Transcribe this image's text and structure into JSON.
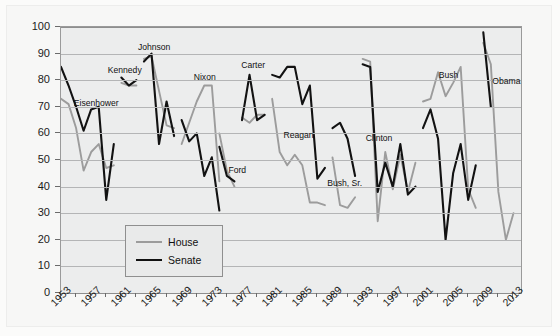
{
  "chart_data": {
    "type": "line",
    "title": "",
    "xlabel": "",
    "ylabel": "Percentage",
    "xlim": [
      1953,
      2014
    ],
    "ylim": [
      0,
      100
    ],
    "grid": true,
    "y_ticks": [
      0,
      10,
      20,
      30,
      40,
      50,
      60,
      70,
      80,
      90,
      100
    ],
    "x_tick_labels": [
      "1953",
      "1957",
      "1961",
      "1965",
      "1969",
      "1973",
      "1977",
      "1981",
      "1985",
      "1989",
      "1993",
      "1997",
      "2001",
      "2005",
      "2009",
      "2013"
    ],
    "x_minor_tick_step": 2,
    "legend": {
      "position": "inside-lower-left",
      "entries": [
        {
          "label": "House",
          "color": "#9c9c9c"
        },
        {
          "label": "Senate",
          "color": "#121212"
        }
      ]
    },
    "series": [
      {
        "name": "House",
        "color": "#9c9c9c",
        "segments": [
          {
            "era": "Eisenhower",
            "x": [
              1953,
              1954,
              1955,
              1956,
              1957,
              1958,
              1959,
              1960
            ],
            "y": [
              73,
              71,
              62,
              46,
              53,
              56,
              47,
              48
            ]
          },
          {
            "era": "Kennedy",
            "x": [
              1961,
              1962,
              1963
            ],
            "y": [
              79,
              78,
              78
            ]
          },
          {
            "era": "Johnson",
            "x": [
              1964,
              1965,
              1966,
              1967,
              1968
            ],
            "y": [
              88,
              89,
              76,
              63,
              62
            ]
          },
          {
            "era": "Nixon",
            "x": [
              1969,
              1970,
              1971,
              1972,
              1973,
              1974
            ],
            "y": [
              56,
              64,
              72,
              78,
              78,
              42
            ]
          },
          {
            "era": "Ford",
            "x": [
              1974,
              1975,
              1976
            ],
            "y": [
              60,
              46,
              40
            ]
          },
          {
            "era": "Carter",
            "x": [
              1977,
              1978,
              1979,
              1980
            ],
            "y": [
              66,
              64,
              67,
              67
            ]
          },
          {
            "era": "Reagan",
            "x": [
              1981,
              1982,
              1983,
              1984,
              1985,
              1986,
              1987,
              1988
            ],
            "y": [
              73,
              53,
              48,
              52,
              48,
              34,
              34,
              33
            ]
          },
          {
            "era": "Bush, Sr.",
            "x": [
              1989,
              1990,
              1991,
              1992
            ],
            "y": [
              51,
              33,
              32,
              36
            ]
          },
          {
            "era": "Clinton",
            "x": [
              1993,
              1994,
              1995,
              1996,
              1997,
              1998,
              1999,
              2000
            ],
            "y": [
              88,
              87,
              27,
              53,
              39,
              52,
              38,
              49
            ]
          },
          {
            "era": "Bush",
            "x": [
              2001,
              2002,
              2003,
              2004,
              2005,
              2006,
              2007,
              2008
            ],
            "y": [
              72,
              73,
              83,
              74,
              79,
              85,
              39,
              32
            ]
          },
          {
            "era": "Obama",
            "x": [
              2009,
              2010,
              2011,
              2012,
              2013
            ],
            "y": [
              94,
              86,
              38,
              20,
              30
            ]
          }
        ]
      },
      {
        "name": "Senate",
        "color": "#121212",
        "segments": [
          {
            "era": "Eisenhower",
            "x": [
              1953,
              1954,
              1955,
              1956,
              1957,
              1958,
              1959,
              1960
            ],
            "y": [
              85,
              78,
              70,
              61,
              69,
              70,
              35,
              56
            ]
          },
          {
            "era": "Kennedy",
            "x": [
              1961,
              1962,
              1963
            ],
            "y": [
              81,
              78,
              80
            ]
          },
          {
            "era": "Johnson",
            "x": [
              1964,
              1965,
              1966,
              1967,
              1968
            ],
            "y": [
              87,
              90,
              56,
              72,
              59
            ]
          },
          {
            "era": "Nixon",
            "x": [
              1969,
              1970,
              1971,
              1972,
              1973,
              1974
            ],
            "y": [
              65,
              57,
              60,
              44,
              51,
              31
            ]
          },
          {
            "era": "Ford",
            "x": [
              1974,
              1975,
              1976
            ],
            "y": [
              55,
              44,
              42
            ]
          },
          {
            "era": "Carter",
            "x": [
              1977,
              1978,
              1979,
              1980
            ],
            "y": [
              65,
              82,
              65,
              67
            ]
          },
          {
            "era": "Reagan",
            "x": [
              1981,
              1982,
              1983,
              1984,
              1985,
              1986,
              1987,
              1988
            ],
            "y": [
              82,
              81,
              85,
              85,
              71,
              78,
              43,
              47
            ]
          },
          {
            "era": "Bush, Sr.",
            "x": [
              1989,
              1990,
              1991,
              1992
            ],
            "y": [
              62,
              64,
              58,
              44
            ]
          },
          {
            "era": "Clinton",
            "x": [
              1993,
              1994,
              1995,
              1996,
              1997,
              1998,
              1999,
              2000
            ],
            "y": [
              86,
              85,
              38,
              49,
              40,
              56,
              37,
              40
            ]
          },
          {
            "era": "Bush",
            "x": [
              2001,
              2002,
              2003,
              2004,
              2005,
              2006,
              2007,
              2008
            ],
            "y": [
              62,
              69,
              58,
              20,
              45,
              56,
              35,
              48
            ]
          },
          {
            "era": "Obama",
            "x": [
              2009,
              2010
            ],
            "y": [
              98,
              70
            ]
          }
        ]
      }
    ],
    "annotations": [
      {
        "text": "Eisenhower",
        "x": 1954.7,
        "y": 71.0
      },
      {
        "text": "Kennedy",
        "x": 1959.2,
        "y": 83.5
      },
      {
        "text": "Johnson",
        "x": 1963.2,
        "y": 92.0
      },
      {
        "text": "Nixon",
        "x": 1970.6,
        "y": 81.0
      },
      {
        "text": "Ford",
        "x": 1975.2,
        "y": 46.0
      },
      {
        "text": "Carter",
        "x": 1976.9,
        "y": 85.5
      },
      {
        "text": "Reagan",
        "x": 1982.5,
        "y": 59.0
      },
      {
        "text": "Bush, Sr.",
        "x": 1988.3,
        "y": 41.0
      },
      {
        "text": "Clinton",
        "x": 1993.4,
        "y": 58.0
      },
      {
        "text": "Bush",
        "x": 2003.1,
        "y": 81.5
      },
      {
        "text": "Obama",
        "x": 2010.2,
        "y": 79.5
      }
    ]
  }
}
